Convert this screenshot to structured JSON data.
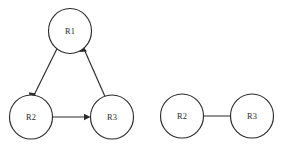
{
  "canvas": {
    "width": 300,
    "height": 145,
    "background": "#ffffff",
    "stroke_color": "#2b2b2b",
    "label_color": "#2a2a2a",
    "node_fill": "#ffffff",
    "node_radius": 21.5
  },
  "graphs": [
    {
      "id": "left-graph",
      "name": "directed-cycle-graph",
      "nodes": [
        {
          "id": "L-R1",
          "label": "R1",
          "cx": 70,
          "cy": 31,
          "r": 21.5
        },
        {
          "id": "L-R2",
          "label": "R2",
          "cx": 31,
          "cy": 117,
          "r": 21.5
        },
        {
          "id": "L-R3",
          "label": "R3",
          "cx": 112,
          "cy": 117,
          "r": 21.5
        }
      ],
      "edges": [
        {
          "id": "L-E1",
          "from": "R1",
          "to": "R2",
          "direction": "one-way",
          "arrowheads": 1
        },
        {
          "id": "L-E2",
          "from": "R2",
          "to": "R3",
          "direction": "one-way",
          "arrowheads": 1
        },
        {
          "id": "L-E3",
          "from": "R3",
          "to": "R1",
          "direction": "one-way",
          "arrowheads": 1
        }
      ]
    },
    {
      "id": "right-graph",
      "name": "bidirectional-pair-graph",
      "nodes": [
        {
          "id": "R-R2",
          "label": "R2",
          "cx": 182,
          "cy": 116,
          "r": 21.5
        },
        {
          "id": "R-R3",
          "label": "R3",
          "cx": 252,
          "cy": 116,
          "r": 21.5
        }
      ],
      "edges": [
        {
          "id": "R-E1",
          "from": "R2",
          "to": "R3",
          "direction": "bidirectional",
          "arrowheads": 2
        }
      ]
    }
  ]
}
